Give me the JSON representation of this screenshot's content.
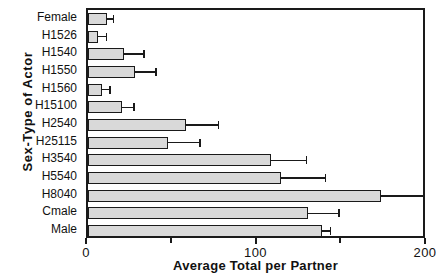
{
  "chart_data": {
    "type": "bar",
    "orientation": "horizontal",
    "title": "",
    "xlabel": "Average Total per Partner",
    "ylabel": "Sex-Type of Actor",
    "xlim": [
      0,
      200
    ],
    "xticks": [
      0,
      100,
      200
    ],
    "xticklabels": [
      "0",
      "100",
      "200"
    ],
    "grid": false,
    "legend": null,
    "bar_color": "#d9d9d9",
    "edge_color": "#1a1a1a",
    "error_bars": true,
    "categories": [
      "Female",
      "H1526",
      "H1540",
      "H1550",
      "H1560",
      "H15100",
      "H2540",
      "H25115",
      "H3540",
      "H5540",
      "H8040",
      "Cmale",
      "Male"
    ],
    "values": [
      11,
      6,
      21,
      28,
      8,
      20,
      58,
      47,
      108,
      114,
      173,
      130,
      138
    ],
    "errors_upper": [
      15,
      11,
      33,
      40,
      13,
      27,
      77,
      66,
      129,
      140,
      198,
      148,
      143
    ]
  }
}
